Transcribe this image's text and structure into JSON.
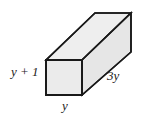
{
  "figure": {
    "name": "rectangular-prism-diagram",
    "shape": "rectangular prism",
    "projection": "oblique",
    "colors": {
      "face_fill": "#ebebeb",
      "top_fill": "#eeeeee",
      "side_fill": "#e6e6e6",
      "outline": "#1a1a1a",
      "background": "#ffffff",
      "label_color": "#1a1a1a"
    },
    "labels": {
      "height": "y + 1",
      "width": "y",
      "depth": "3y"
    },
    "geometry": {
      "front_face": "46,60 82,60 82,95 46,95",
      "top_face": "46,60 82,60 131,13 95,13",
      "right_face": "82,60 131,13 131,52 82,95",
      "back_vertical_edge": "131,13 131,52",
      "hidden_edges": false
    }
  }
}
